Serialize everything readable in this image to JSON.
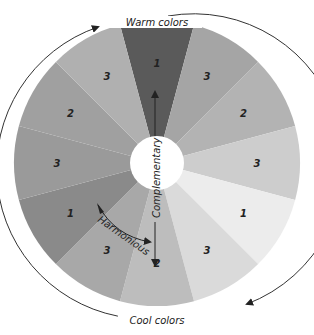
{
  "diagram": {
    "outer_labels": {
      "top": "Warm colors",
      "bottom": "Cool colors"
    },
    "inner_labels": {
      "vertical": "Complementary",
      "curved": "Harmonious"
    },
    "segments": [
      {
        "label": "1",
        "color": "#5a5a5a"
      },
      {
        "label": "3",
        "color": "#a5a5a5"
      },
      {
        "label": "2",
        "color": "#b3b3b3"
      },
      {
        "label": "3",
        "color": "#cdcdcd"
      },
      {
        "label": "1",
        "color": "#ececec"
      },
      {
        "label": "3",
        "color": "#dadada"
      },
      {
        "label": "2",
        "color": "#bdbdbd"
      },
      {
        "label": "3",
        "color": "#a8a8a8"
      },
      {
        "label": "1",
        "color": "#8a8a8a"
      },
      {
        "label": "3",
        "color": "#9a9a9a"
      },
      {
        "label": "2",
        "color": "#a0a0a0"
      },
      {
        "label": "3",
        "color": "#b0b0b0"
      }
    ]
  }
}
